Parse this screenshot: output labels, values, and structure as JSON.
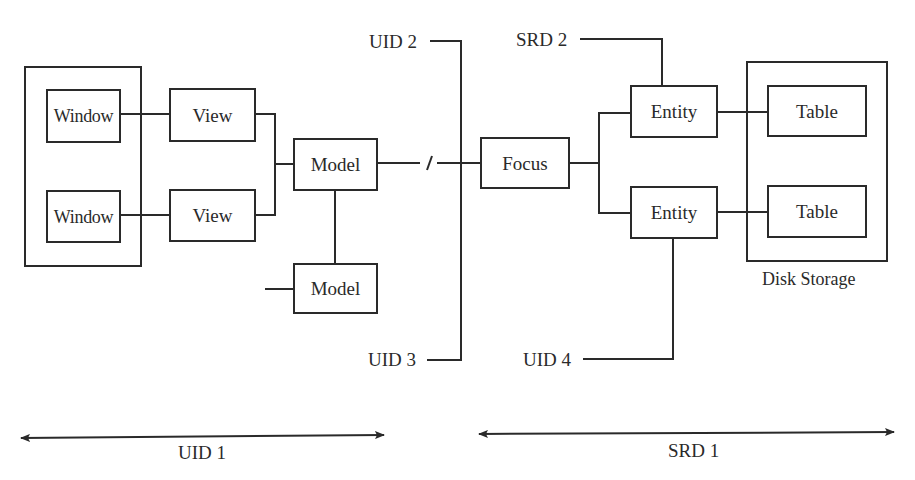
{
  "diagram": {
    "colors": {
      "stroke": "#2a2a2a",
      "background": "#ffffff"
    },
    "groups": {
      "window_group": {
        "label": ""
      },
      "disk_storage": {
        "label": "Disk Storage"
      }
    },
    "nodes": {
      "window_1": {
        "label": "Window"
      },
      "window_2": {
        "label": "Window"
      },
      "view_1": {
        "label": "View"
      },
      "view_2": {
        "label": "View"
      },
      "model_1": {
        "label": "Model"
      },
      "model_2": {
        "label": "Model"
      },
      "focus": {
        "label": "Focus"
      },
      "entity_1": {
        "label": "Entity"
      },
      "entity_2": {
        "label": "Entity"
      },
      "table_1": {
        "label": "Table"
      },
      "table_2": {
        "label": "Table"
      }
    },
    "interfaces": {
      "uid2": {
        "label": "UID 2"
      },
      "uid3": {
        "label": "UID 3"
      },
      "uid4": {
        "label": "UID 4"
      },
      "srd2": {
        "label": "SRD 2"
      }
    },
    "spans": {
      "uid1": {
        "label": "UID 1",
        "direction": "bidirectional"
      },
      "srd1": {
        "label": "SRD 1",
        "direction": "bidirectional"
      }
    },
    "edges": [
      [
        "window_1",
        "view_1"
      ],
      [
        "window_2",
        "view_2"
      ],
      [
        "view_1",
        "model_1"
      ],
      [
        "view_2",
        "model_1"
      ],
      [
        "model_1",
        "model_2"
      ],
      [
        "model_1",
        "focus",
        "broken-link"
      ],
      [
        "uid2",
        "uid3",
        "boundary-bus"
      ],
      [
        "focus",
        "entity_1"
      ],
      [
        "focus",
        "entity_2"
      ],
      [
        "srd2",
        "entity_1"
      ],
      [
        "entity_1",
        "table_1"
      ],
      [
        "entity_2",
        "table_2"
      ],
      [
        "entity_2",
        "uid4"
      ]
    ]
  }
}
